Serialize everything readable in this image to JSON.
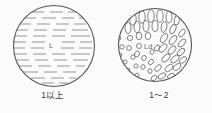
{
  "figure": {
    "background_color": "#fbfbfb",
    "stroke_color": "#555555",
    "panels": [
      {
        "id": "left",
        "caption": "1以上",
        "inner_label": "L",
        "fill_style": "horizontal-dashes",
        "circle": {
          "cx": 54,
          "cy": 46,
          "r": 41
        }
      },
      {
        "id": "right",
        "caption": "1～2",
        "inner_label": "Ld",
        "fill_style": "scattered-ellipses",
        "circle": {
          "cx": 49,
          "cy": 45,
          "r": 37
        }
      }
    ]
  }
}
